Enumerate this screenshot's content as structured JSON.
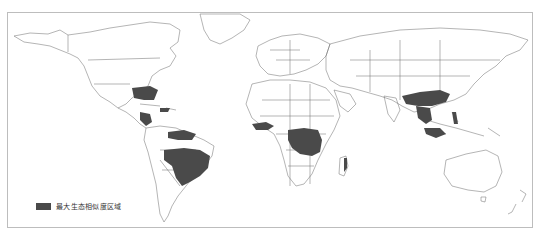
{
  "map": {
    "type": "world-choropleth",
    "projection": "equirectangular-like",
    "colors": {
      "land_fill": "#ffffff",
      "border": "#6b6b6b",
      "highlight": "#4a4a4a",
      "frame": "#bdbdbd"
    },
    "highlighted_regions": [
      "Southeastern United States",
      "Central America & Mexico (south)",
      "Caribbean (Cuba, Hispaniola)",
      "Northern South America (Venezuela, Guyana, Colombia)",
      "Amazon basin & Brazil (central/south-east)",
      "West Africa (Guinea coast)",
      "Central Africa (Congo basin)",
      "East Africa (Lake Victoria region)",
      "Madagascar (east)",
      "Southern China",
      "Indochina (Myanmar, Thailand, Laos, Vietnam)",
      "Philippines",
      "Indonesia / Malaysia islands"
    ]
  },
  "legend": {
    "items": [
      {
        "label": "最大生态相似度区域",
        "color": "#4a4a4a"
      }
    ]
  }
}
